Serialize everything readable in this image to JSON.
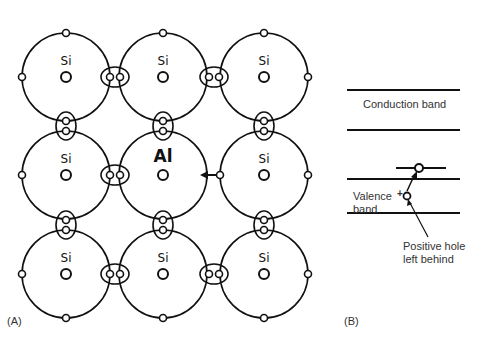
{
  "panel_a": {
    "label": "(A)",
    "atoms": [
      [
        "Si",
        "Si",
        "Si"
      ],
      [
        "Si",
        "Al",
        "Si"
      ],
      [
        "Si",
        "Si",
        "Si"
      ]
    ]
  },
  "panel_b": {
    "label": "(B)",
    "conduction_band": "Conduction band",
    "valence_band_line1": "Valence",
    "valence_band_line2": "band",
    "plus_sign": "+",
    "hole_label_line1": "Positive hole",
    "hole_label_line2": "left behind"
  },
  "colors": {
    "line": "#111111",
    "text": "#333333",
    "background": "#ffffff"
  }
}
